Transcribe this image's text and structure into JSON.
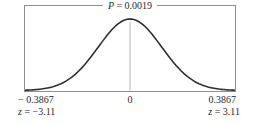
{
  "chart_data": {
    "type": "area",
    "subtype": "standard-normal-distribution-curve",
    "title": "",
    "grid": false,
    "legend": false,
    "p_annotation": {
      "symbol": "P",
      "rest": " = 0.0019",
      "value": 0.0019
    },
    "x_axis": {
      "tick_labels": [
        "− 0.3867",
        "0",
        "0.3867"
      ],
      "tick_values": [
        -0.3867,
        0,
        0.3867
      ]
    },
    "z_axis": {
      "left": {
        "symbol": "z",
        "rest": " = −3.11",
        "value": -3.11
      },
      "right": {
        "symbol": "z",
        "rest": " = 3.11",
        "value": 3.11
      }
    },
    "curve": {
      "distribution": "gaussian",
      "mean": 0,
      "sd": 1,
      "plot_halfwidth_sigma": 3.3,
      "peak_x_label": "0"
    },
    "colors": {
      "curve": "#2f2f2f",
      "frame": "#8f8f8f",
      "centerline": "#b5b5b5",
      "text": "#2b2b2b",
      "background": "#ffffff"
    }
  }
}
